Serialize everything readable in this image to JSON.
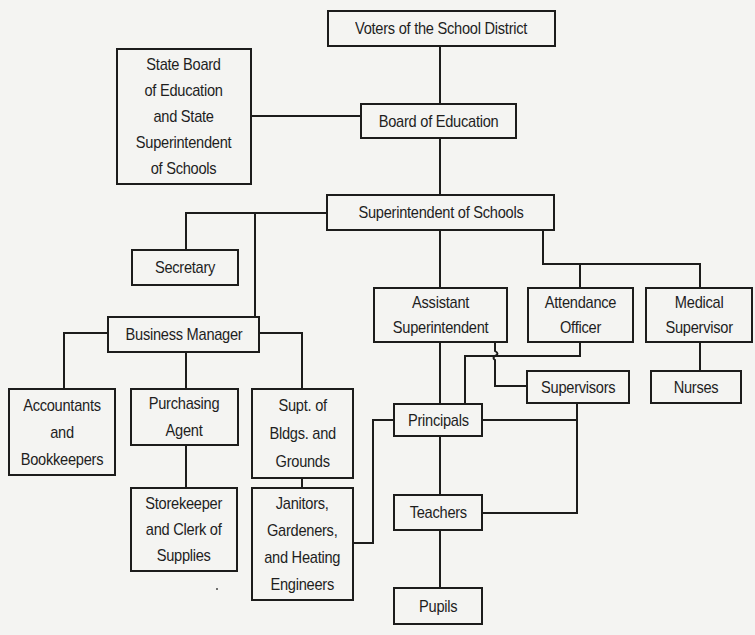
{
  "diagram": {
    "type": "organization-chart",
    "title_visible": false,
    "line_color": "#1c1c1c",
    "background_color": "#f4f4f2",
    "nodes": {
      "voters": {
        "label": "Voters of the School District"
      },
      "state_board": {
        "label": "State Board\nof Education\nand State\nSuperintendent\nof Schools"
      },
      "board_of_education": {
        "label": "Board of Education"
      },
      "superintendent": {
        "label": "Superintendent of Schools"
      },
      "secretary": {
        "label": "Secretary"
      },
      "business_manager": {
        "label": "Business Manager"
      },
      "assistant_superintendent": {
        "label": "Assistant\nSuperintendent"
      },
      "attendance_officer": {
        "label": "Attendance\nOfficer"
      },
      "medical_supervisor": {
        "label": "Medical\nSupervisor"
      },
      "supervisors": {
        "label": "Supervisors"
      },
      "nurses": {
        "label": "Nurses"
      },
      "principals": {
        "label": "Principals"
      },
      "accountants": {
        "label": "Accountants\nand\nBookkeepers"
      },
      "purchasing_agent": {
        "label": "Purchasing\nAgent"
      },
      "supt_bldgs": {
        "label": "Supt. of\nBldgs. and\nGrounds"
      },
      "storekeeper": {
        "label": "Storekeeper\nand Clerk of\nSupplies"
      },
      "janitors": {
        "label": "Janitors,\nGardeners,\nand Heating\nEngineers"
      },
      "teachers": {
        "label": "Teachers"
      },
      "pupils": {
        "label": "Pupils"
      }
    },
    "edges": [
      [
        "voters",
        "board_of_education"
      ],
      [
        "state_board",
        "board_of_education"
      ],
      [
        "board_of_education",
        "superintendent"
      ],
      [
        "superintendent",
        "secretary"
      ],
      [
        "superintendent",
        "business_manager"
      ],
      [
        "superintendent",
        "assistant_superintendent"
      ],
      [
        "superintendent",
        "attendance_officer"
      ],
      [
        "superintendent",
        "medical_supervisor"
      ],
      [
        "business_manager",
        "accountants"
      ],
      [
        "business_manager",
        "purchasing_agent"
      ],
      [
        "business_manager",
        "supt_bldgs"
      ],
      [
        "purchasing_agent",
        "storekeeper"
      ],
      [
        "supt_bldgs",
        "janitors"
      ],
      [
        "assistant_superintendent",
        "principals"
      ],
      [
        "assistant_superintendent",
        "supervisors"
      ],
      [
        "attendance_officer",
        "principals"
      ],
      [
        "medical_supervisor",
        "nurses"
      ],
      [
        "supervisors",
        "principals"
      ],
      [
        "supervisors",
        "teachers"
      ],
      [
        "principals",
        "teachers"
      ],
      [
        "janitors",
        "principals"
      ],
      [
        "teachers",
        "pupils"
      ]
    ]
  }
}
